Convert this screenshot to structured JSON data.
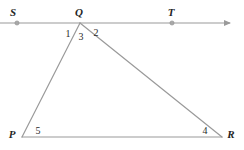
{
  "diagram": {
    "type": "geometry-figure",
    "canvas": {
      "width": 244,
      "height": 150,
      "background": "#ffffff"
    },
    "style": {
      "stroke_color": "#9a9a9a",
      "stroke_width": 1.2,
      "label_color": "#252525",
      "angle_label_color": "#2a2a2a",
      "point_marker_color": "#9a9a9a"
    },
    "points": [
      {
        "id": "S",
        "label": "S",
        "x": 17,
        "y": 23,
        "label_x": 13,
        "label_y": 12,
        "marker": true
      },
      {
        "id": "Q",
        "label": "Q",
        "x": 80,
        "y": 23,
        "label_x": 79,
        "label_y": 12,
        "marker": false
      },
      {
        "id": "T",
        "label": "T",
        "x": 172,
        "y": 23,
        "label_x": 171,
        "label_y": 12,
        "marker": true
      },
      {
        "id": "P",
        "label": "P",
        "x": 22,
        "y": 137,
        "label_x": 12,
        "label_y": 134,
        "marker": false
      },
      {
        "id": "R",
        "label": "R",
        "x": 222,
        "y": 137,
        "label_x": 231,
        "label_y": 134,
        "marker": false
      }
    ],
    "segments": [
      {
        "id": "line-ST",
        "name": "ray-S-T",
        "x1": 0,
        "y1": 23,
        "x2": 230,
        "y2": 23,
        "arrow_end": true,
        "arrow_start": false
      },
      {
        "id": "segment-PQ",
        "name": "segment-P-Q",
        "x1": 22,
        "y1": 137,
        "x2": 80,
        "y2": 23,
        "arrow_end": false,
        "arrow_start": false
      },
      {
        "id": "segment-QR",
        "name": "segment-Q-R",
        "x1": 80,
        "y1": 23,
        "x2": 222,
        "y2": 137,
        "arrow_end": false,
        "arrow_start": false
      },
      {
        "id": "segment-PR",
        "name": "segment-P-R",
        "x1": 22,
        "y1": 137,
        "x2": 222,
        "y2": 137,
        "arrow_end": false,
        "arrow_start": false
      }
    ],
    "angles": [
      {
        "id": "angle-1",
        "label": "1",
        "x": 68,
        "y": 34,
        "vertex": "Q",
        "description": "between ray QS and segment QP"
      },
      {
        "id": "angle-3",
        "label": "3",
        "x": 81,
        "y": 37,
        "vertex": "Q",
        "description": "interior angle PQR"
      },
      {
        "id": "angle-2",
        "label": "2",
        "x": 96,
        "y": 33,
        "vertex": "Q",
        "description": "between segment QR and ray QT"
      },
      {
        "id": "angle-5",
        "label": "5",
        "x": 38,
        "y": 131,
        "vertex": "P",
        "description": "interior angle QPR"
      },
      {
        "id": "angle-4",
        "label": "4",
        "x": 205,
        "y": 131,
        "vertex": "R",
        "description": "interior angle QRP"
      }
    ]
  }
}
